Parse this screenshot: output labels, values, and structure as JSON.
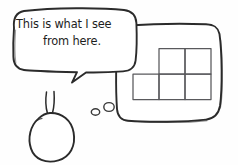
{
  "scene": {
    "title": "This is what I see from here.",
    "background_color": "#fefefe",
    "ink_color": "#2b2b2b",
    "grid_color": "#59595c",
    "width": 238,
    "height": 165
  },
  "speech_bubble": {
    "line1": "This is what I see",
    "line2": "from here.",
    "full_text": "This is what I see from here.",
    "tail_direction": "down-left",
    "shape": "rounded-rectangle-handdrawn"
  },
  "character": {
    "name": "round-creature",
    "body_shape": "circle",
    "antennae_count": 2,
    "puff_marks": 2
  },
  "panel": {
    "name": "vision-panel",
    "shape": "rounded-rectangle-handdrawn",
    "contents": "pentomino-grid"
  },
  "pentomino": {
    "name": "p-pentomino",
    "cell_count": 5,
    "rows": [
      {
        "row_index": 0,
        "cells": 2,
        "offset_cells": 1
      },
      {
        "row_index": 1,
        "cells": 3,
        "offset_cells": 0
      }
    ],
    "cell_size_px": 26,
    "description": "Top row has 2 cells offset right, bottom row has 3 cells"
  }
}
